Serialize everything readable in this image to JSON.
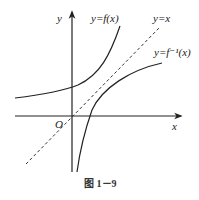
{
  "figure": {
    "caption": "图 1－9",
    "axes": {
      "x_label": "x",
      "y_label": "y",
      "origin_label": "O"
    },
    "curves": [
      {
        "name": "exponential-like function",
        "label": "y=f(x)"
      },
      {
        "name": "identity line (dashed)",
        "label": "y=x"
      },
      {
        "name": "inverse function",
        "label": "y=f⁻¹(x)"
      }
    ],
    "colors": {
      "stroke": "#222222",
      "background": "#ffffff"
    }
  }
}
